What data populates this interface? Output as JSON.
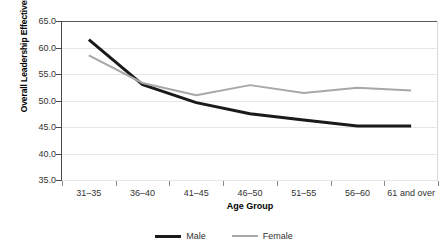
{
  "chart_data": {
    "type": "line",
    "title": "",
    "xlabel": "Age Group",
    "ylabel": "Overall Leadership Effectiveness",
    "categories": [
      "31–35",
      "36–40",
      "41–45",
      "46–50",
      "51–55",
      "56–60",
      "61 and over"
    ],
    "ylim": [
      35.0,
      65.0
    ],
    "yticks": [
      "35.0",
      "40.0",
      "45.0",
      "50.0",
      "55.0",
      "60.0",
      "65.0"
    ],
    "ytick_values": [
      35.0,
      40.0,
      45.0,
      50.0,
      55.0,
      60.0,
      65.0
    ],
    "grid": true,
    "legend_position": "bottom",
    "series": [
      {
        "name": "Male",
        "color": "#1a1a1a",
        "width": 3,
        "values": [
          61.5,
          53.0,
          49.6,
          47.5,
          46.3,
          45.2,
          45.2
        ]
      },
      {
        "name": "Female",
        "color": "#a8a8a8",
        "width": 2,
        "values": [
          58.5,
          53.3,
          51.0,
          52.9,
          51.4,
          52.4,
          51.9
        ]
      }
    ]
  }
}
